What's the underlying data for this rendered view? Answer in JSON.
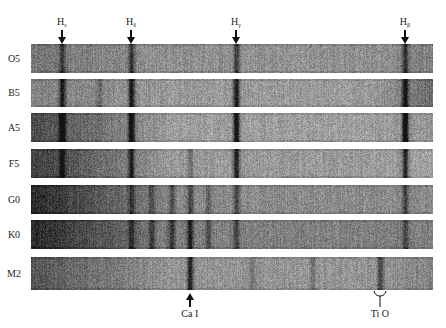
{
  "figure": {
    "spectral_types": [
      {
        "label": "O5",
        "darkness_left": 0.55,
        "darkness_right": 0.5,
        "base": 0.42
      },
      {
        "label": "B5",
        "darkness_left": 0.5,
        "darkness_right": 0.6,
        "base": 0.38
      },
      {
        "label": "A5",
        "darkness_left": 0.75,
        "darkness_right": 0.4,
        "base": 0.36
      },
      {
        "label": "F5",
        "darkness_left": 0.8,
        "darkness_right": 0.35,
        "base": 0.38
      },
      {
        "label": "G0",
        "darkness_left": 0.9,
        "darkness_right": 0.45,
        "base": 0.45
      },
      {
        "label": "K0",
        "darkness_left": 0.9,
        "darkness_right": 0.5,
        "base": 0.5
      },
      {
        "label": "M2",
        "darkness_left": 0.7,
        "darkness_right": 0.5,
        "base": 0.4
      }
    ],
    "top_markers": [
      {
        "label": "H",
        "subscript": "ε",
        "position": 0.077
      },
      {
        "label": "H",
        "subscript": "δ",
        "position": 0.249
      },
      {
        "label": "H",
        "subscript": "γ",
        "position": 0.51
      },
      {
        "label": "H",
        "subscript": "β",
        "position": 0.93
      }
    ],
    "bottom_markers": [
      {
        "label": "Ca I",
        "position": 0.395,
        "style": "arrow"
      },
      {
        "label": "Ti O",
        "position": 0.868,
        "style": "bracket"
      }
    ],
    "absorption_lines": {
      "O5": [
        [
          0.077,
          0.35
        ],
        [
          0.249,
          0.4
        ],
        [
          0.51,
          0.4
        ],
        [
          0.93,
          0.45
        ]
      ],
      "B5": [
        [
          0.077,
          0.55
        ],
        [
          0.249,
          0.6
        ],
        [
          0.51,
          0.6
        ],
        [
          0.93,
          0.6
        ],
        [
          0.17,
          0.2
        ]
      ],
      "A5": [
        [
          0.077,
          0.6
        ],
        [
          0.249,
          0.7
        ],
        [
          0.51,
          0.75
        ],
        [
          0.93,
          0.8
        ]
      ],
      "F5": [
        [
          0.077,
          0.4
        ],
        [
          0.249,
          0.45
        ],
        [
          0.51,
          0.6
        ],
        [
          0.93,
          0.55
        ],
        [
          0.395,
          0.2
        ]
      ],
      "G0": [
        [
          0.249,
          0.3
        ],
        [
          0.395,
          0.35
        ],
        [
          0.35,
          0.3
        ],
        [
          0.51,
          0.3
        ],
        [
          0.93,
          0.35
        ],
        [
          0.3,
          0.25
        ],
        [
          0.44,
          0.2
        ]
      ],
      "K0": [
        [
          0.249,
          0.3
        ],
        [
          0.395,
          0.5
        ],
        [
          0.35,
          0.35
        ],
        [
          0.3,
          0.3
        ],
        [
          0.44,
          0.25
        ],
        [
          0.51,
          0.3
        ],
        [
          0.93,
          0.3
        ]
      ],
      "M2": [
        [
          0.395,
          0.55
        ],
        [
          0.868,
          0.35
        ],
        [
          0.7,
          0.15
        ],
        [
          0.55,
          0.15
        ]
      ]
    }
  }
}
